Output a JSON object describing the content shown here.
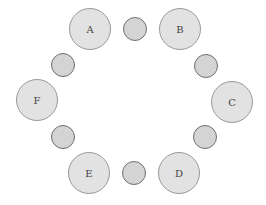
{
  "diagram": {
    "type": "round-table-seating",
    "seats": [
      {
        "label": "A",
        "x": 90,
        "y": 29
      },
      {
        "label": "B",
        "x": 180,
        "y": 29
      },
      {
        "label": "C",
        "x": 232,
        "y": 102
      },
      {
        "label": "D",
        "x": 179,
        "y": 173
      },
      {
        "label": "E",
        "x": 89,
        "y": 173
      },
      {
        "label": "F",
        "x": 37,
        "y": 100
      }
    ],
    "empty_seats": [
      {
        "x": 135,
        "y": 29
      },
      {
        "x": 206,
        "y": 66
      },
      {
        "x": 205,
        "y": 137
      },
      {
        "x": 134,
        "y": 173
      },
      {
        "x": 63,
        "y": 137
      },
      {
        "x": 63,
        "y": 65
      }
    ],
    "colors": {
      "big_fill": "#e2e2e2",
      "big_border": "#9a9a9a",
      "small_fill": "#d4d4d4",
      "small_border": "#6f6f6f"
    }
  }
}
